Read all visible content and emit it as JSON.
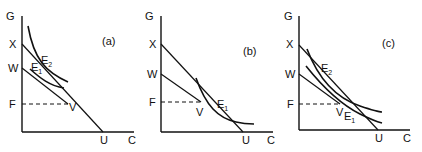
{
  "figure": {
    "panels": [
      {
        "id": "a",
        "tag": "(a)",
        "y_axis_label": "G",
        "x_axis_label": "C",
        "points": {
          "x": "X",
          "w": "W",
          "f": "F",
          "v": "V",
          "u": "U"
        },
        "equilibria": [
          {
            "base": "E",
            "sub": "1"
          },
          {
            "base": "E",
            "sub": "2"
          }
        ]
      },
      {
        "id": "b",
        "tag": "(b)",
        "y_axis_label": "G",
        "x_axis_label": "C",
        "points": {
          "x": "X",
          "w": "W",
          "f": "F",
          "v": "V",
          "u": "U"
        },
        "equilibria": [
          {
            "base": "E",
            "sub": "1"
          }
        ]
      },
      {
        "id": "c",
        "tag": "(c)",
        "y_axis_label": "G",
        "x_axis_label": "C",
        "points": {
          "x": "X",
          "w": "W",
          "f": "F",
          "v": "V",
          "u": "U"
        },
        "equilibria": [
          {
            "base": "E",
            "sub": "1"
          },
          {
            "base": "E",
            "sub": "2"
          }
        ]
      }
    ],
    "colors": {
      "ink": "#111111",
      "background": "#ffffff"
    }
  }
}
